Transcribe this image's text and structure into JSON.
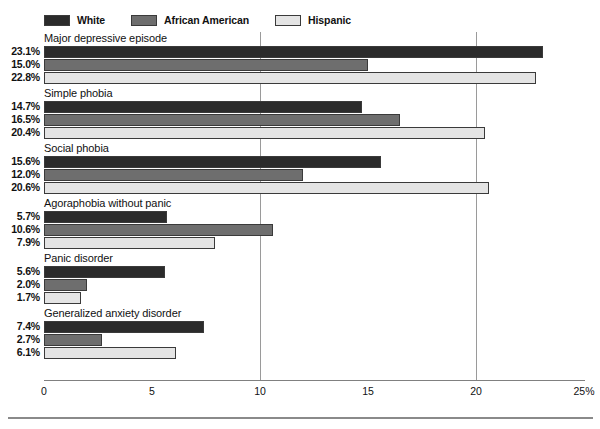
{
  "chart_data": {
    "type": "bar",
    "orientation": "horizontal",
    "title": "",
    "xlabel": "",
    "ylabel": "",
    "xlim": [
      0,
      25
    ],
    "xticks": [
      0,
      5,
      10,
      15,
      20,
      25
    ],
    "xtick_labels": [
      "0",
      "5",
      "10",
      "15",
      "20",
      "25%"
    ],
    "grid": true,
    "gridlines_at": [
      10,
      20
    ],
    "legend_position": "top-left",
    "categories": [
      "Major depressive episode",
      "Simple phobia",
      "Social phobia",
      "Agoraphobia without panic",
      "Panic disorder",
      "Generalized anxiety disorder"
    ],
    "series": [
      {
        "name": "White",
        "color": "#2b2b2b",
        "values": [
          23.1,
          14.7,
          15.6,
          5.7,
          5.6,
          7.4
        ],
        "labels": [
          "23.1%",
          "14.7%",
          "15.6%",
          "5.7%",
          "5.6%",
          "7.4%"
        ]
      },
      {
        "name": "African American",
        "color": "#6e6e6e",
        "values": [
          15.0,
          16.5,
          12.0,
          10.6,
          2.0,
          2.7
        ],
        "labels": [
          "15.0%",
          "16.5%",
          "12.0%",
          "10.6%",
          "2.0%",
          "2.7%"
        ]
      },
      {
        "name": "Hispanic",
        "color": "#e4e4e4",
        "values": [
          22.8,
          20.4,
          20.6,
          7.9,
          1.7,
          6.1
        ],
        "labels": [
          "22.8%",
          "20.4%",
          "20.6%",
          "7.9%",
          "1.7%",
          "6.1%"
        ]
      }
    ]
  },
  "legend": {
    "entries": [
      {
        "label": "White",
        "color": "#2b2b2b"
      },
      {
        "label": "African American",
        "color": "#6e6e6e"
      },
      {
        "label": "Hispanic",
        "color": "#e4e4e4"
      }
    ]
  },
  "axis": {
    "tick_labels": [
      "0",
      "5",
      "10",
      "15",
      "20",
      "25%"
    ]
  }
}
